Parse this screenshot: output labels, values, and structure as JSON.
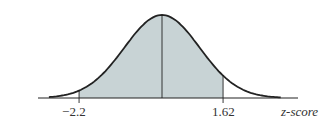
{
  "chart_data": {
    "type": "area",
    "title": "",
    "xlabel": "z-score",
    "ylabel": "",
    "xlim": [
      -3.5,
      3.5
    ],
    "tick_labels": [
      "−2.2",
      "1.62"
    ],
    "ticks": [
      -2.2,
      1.62
    ],
    "shaded_region": {
      "from": -2.2,
      "to": 1.62
    },
    "mean_line": 0,
    "grid": false,
    "legend": null,
    "colors": {
      "fill": "#c8d3d5",
      "curve": "#222222",
      "axis": "#222222"
    }
  },
  "labels": {
    "tick_left": "−2.2",
    "tick_right": "1.62",
    "axis_label": "z-score"
  }
}
